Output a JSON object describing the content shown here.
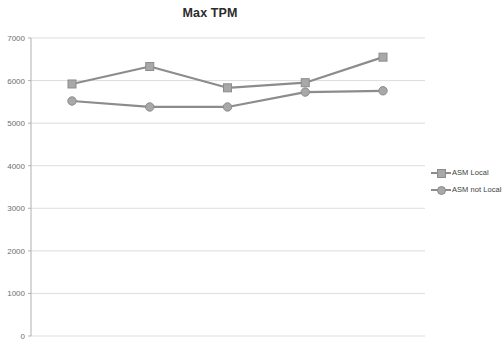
{
  "chart_data": {
    "type": "line",
    "title": "Max TPM",
    "xlabel": "",
    "ylabel": "",
    "ylim": [
      0,
      7000
    ],
    "ytick_labels": [
      "7000",
      "6000",
      "5000",
      "4000",
      "3000",
      "2000",
      "1000",
      "0"
    ],
    "ytick_values": [
      7000,
      6000,
      5000,
      4000,
      3000,
      2000,
      1000,
      0
    ],
    "grid": true,
    "legend_position": "right",
    "x": [
      1,
      2,
      3,
      4,
      5
    ],
    "categories": [
      "1",
      "2",
      "3",
      "4",
      "5"
    ],
    "series": [
      {
        "name": "ASM Local",
        "marker": "square",
        "color": "#8c8c8c",
        "marker_fill": "#a8a8a8",
        "values": [
          5920,
          6330,
          5830,
          5950,
          6550
        ]
      },
      {
        "name": "ASM not Local",
        "marker": "circle",
        "color": "#8c8c8c",
        "marker_fill": "#a8a8a8",
        "values": [
          5520,
          5380,
          5380,
          5730,
          5760
        ]
      }
    ]
  },
  "colors": {
    "series_line": "#8c8c8c",
    "marker_fill": "#a8a8a8",
    "gridline": "#d9d9d9",
    "axis": "#b0b0b0",
    "title_text": "#2b2b2b",
    "tick_text": "#6e6e6e",
    "legend_text": "#3d3d3d",
    "background": "#ffffff"
  },
  "legend": {
    "items": [
      {
        "label": "ASM Local",
        "marker": "square"
      },
      {
        "label": "ASM not Local",
        "marker": "circle"
      }
    ]
  }
}
